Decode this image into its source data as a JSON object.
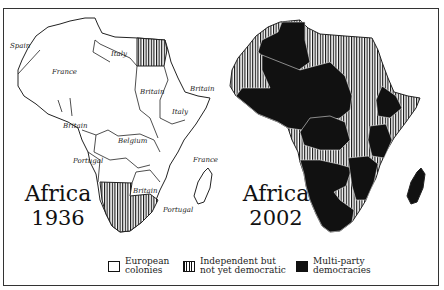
{
  "maps": [
    {
      "id": "left",
      "title": "Africa",
      "year": "1936",
      "labels": [
        {
          "text": "Spain",
          "x": 10,
          "y": 48
        },
        {
          "text": "France",
          "x": 52,
          "y": 74
        },
        {
          "text": "Italy",
          "x": 111,
          "y": 56
        },
        {
          "text": "Britain",
          "x": 140,
          "y": 94
        },
        {
          "text": "Britain",
          "x": 190,
          "y": 91
        },
        {
          "text": "Italy",
          "x": 172,
          "y": 114
        },
        {
          "text": "Britain",
          "x": 63,
          "y": 128
        },
        {
          "text": "Belgium",
          "x": 118,
          "y": 143
        },
        {
          "text": "Portugal",
          "x": 73,
          "y": 163
        },
        {
          "text": "France",
          "x": 193,
          "y": 162
        },
        {
          "text": "Britain",
          "x": 133,
          "y": 193
        },
        {
          "text": "Portugal",
          "x": 163,
          "y": 212
        }
      ]
    },
    {
      "id": "right",
      "title": "Africa",
      "year": "2002"
    }
  ],
  "legend": [
    {
      "key": "european-colonies",
      "line1": "European",
      "line2": "colonies",
      "pattern": "white"
    },
    {
      "key": "independent-not-democratic",
      "line1": "Independent but",
      "line2": "not yet democratic",
      "pattern": "hatch"
    },
    {
      "key": "multi-party-democracies",
      "line1": "Multi-party",
      "line2": "democracies",
      "pattern": "black"
    }
  ],
  "colors": {
    "ink": "#111111",
    "paper": "#ffffff",
    "border": "#333333"
  }
}
